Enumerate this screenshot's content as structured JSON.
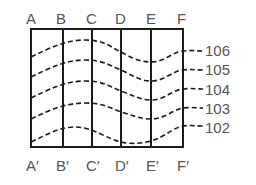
{
  "diagram": {
    "top_labels": [
      "A",
      "B",
      "C",
      "D",
      "E",
      "F"
    ],
    "bottom_labels": [
      "A′",
      "B′",
      "C′",
      "D′",
      "E′",
      "F′"
    ],
    "curve_labels": [
      "106",
      "105",
      "104",
      "103",
      "102"
    ],
    "colors": {
      "lines": "#1a1a1a",
      "text": "#555555",
      "background": "#ffffff"
    }
  }
}
